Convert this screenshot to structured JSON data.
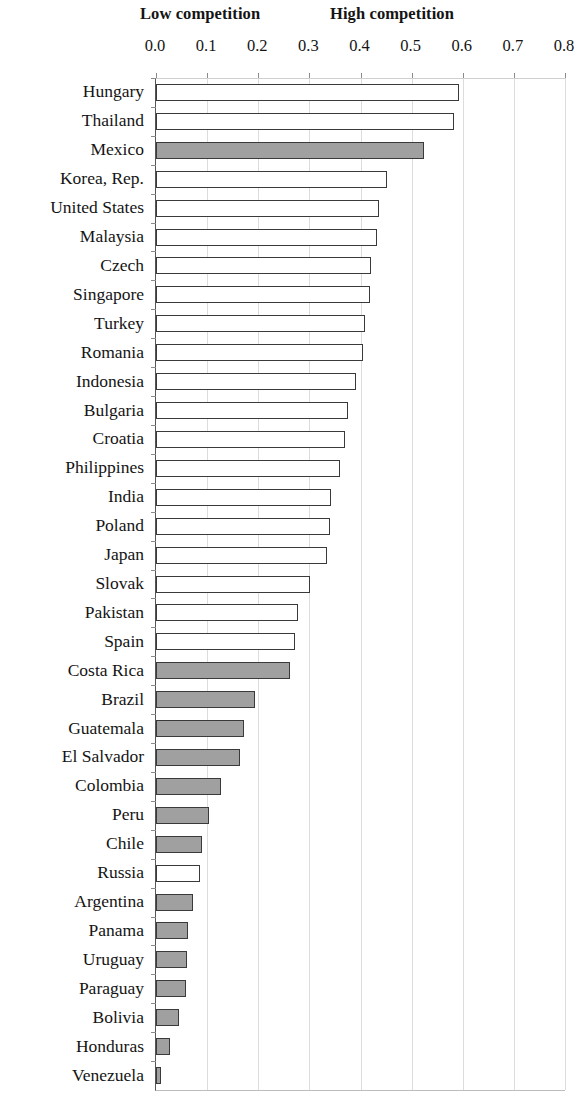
{
  "header": {
    "low_label": "Low competition",
    "high_label": "High competition"
  },
  "axis": {
    "ticks": [
      "0.0",
      "0.1",
      "0.2",
      "0.3",
      "0.4",
      "0.5",
      "0.6",
      "0.7",
      "0.8"
    ]
  },
  "chart_data": {
    "type": "bar",
    "orientation": "horizontal",
    "title": "",
    "subtitle": "",
    "xlabel": "",
    "ylabel": "",
    "xlim": [
      0.0,
      0.8
    ],
    "xticks": [
      0.0,
      0.1,
      0.2,
      0.3,
      0.4,
      0.5,
      0.6,
      0.7,
      0.8
    ],
    "grid": true,
    "legend_position": "none",
    "annotations": [
      "Low competition",
      "High competition"
    ],
    "series_note": "Filled (gray) bars denote Latin American economies; hollow (white) bars denote other economies.",
    "colors": {
      "filled": "#a0a0a0",
      "hollow": "#ffffff",
      "bar_border": "#3a3a3a",
      "gridline": "#dcdcdc"
    },
    "categories": [
      "Hungary",
      "Thailand",
      "Mexico",
      "Korea, Rep.",
      "United States",
      "Malaysia",
      "Czech",
      "Singapore",
      "Turkey",
      "Romania",
      "Indonesia",
      "Bulgaria",
      "Croatia",
      "Philippines",
      "India",
      "Poland",
      "Japan",
      "Slovak",
      "Pakistan",
      "Spain",
      "Costa Rica",
      "Brazil",
      "Guatemala",
      "El Salvador",
      "Colombia",
      "Peru",
      "Chile",
      "Russia",
      "Argentina",
      "Panama",
      "Uruguay",
      "Paraguay",
      "Bolivia",
      "Honduras",
      "Venezuela"
    ],
    "values": [
      0.592,
      0.583,
      0.525,
      0.452,
      0.437,
      0.432,
      0.421,
      0.418,
      0.408,
      0.405,
      0.392,
      0.375,
      0.37,
      0.36,
      0.342,
      0.34,
      0.335,
      0.302,
      0.278,
      0.272,
      0.262,
      0.193,
      0.172,
      0.165,
      0.127,
      0.103,
      0.09,
      0.086,
      0.072,
      0.063,
      0.06,
      0.058,
      0.045,
      0.028,
      0.01
    ],
    "fills": [
      "hollow",
      "hollow",
      "filled",
      "hollow",
      "hollow",
      "hollow",
      "hollow",
      "hollow",
      "hollow",
      "hollow",
      "hollow",
      "hollow",
      "hollow",
      "hollow",
      "hollow",
      "hollow",
      "hollow",
      "hollow",
      "hollow",
      "hollow",
      "filled",
      "filled",
      "filled",
      "filled",
      "filled",
      "filled",
      "filled",
      "hollow",
      "filled",
      "filled",
      "filled",
      "filled",
      "filled",
      "filled",
      "filled"
    ]
  }
}
